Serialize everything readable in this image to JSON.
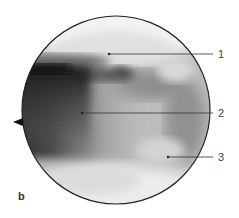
{
  "figure": {
    "panel_label": "b",
    "view": "circular endoscopic view",
    "labels": [
      {
        "number": "1",
        "dot": [
          109,
          54
        ],
        "text_y": 57
      },
      {
        "number": "2",
        "dot": [
          82,
          113
        ],
        "text_y": 116
      },
      {
        "number": "3",
        "dot": [
          168,
          157
        ],
        "text_y": 160
      }
    ],
    "colors": {
      "outline": "#222222",
      "leader_line": "#333333",
      "label_text": "#444444"
    }
  }
}
